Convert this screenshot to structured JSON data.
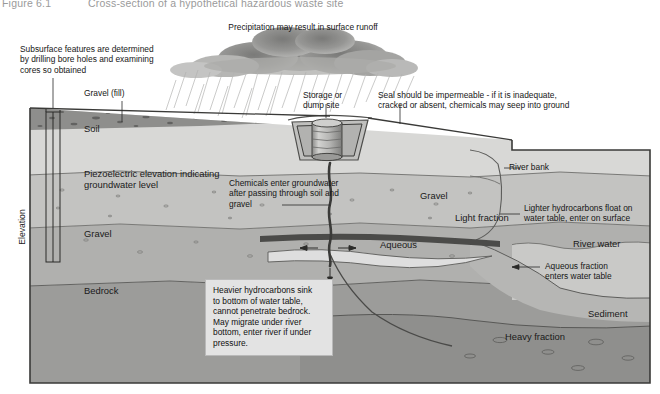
{
  "figure": {
    "number": "Figure 6.1",
    "title": "Cross-section of a hypothetical hazardous waste site"
  },
  "annotations": {
    "precipitation": "Precipitation may result in surface runoff",
    "boreholes": "Subsurface features are determined\nby drilling bore holes and examining\ncores so obtained",
    "gravel_fill": "Gravel (fill)",
    "storage_site": "Storage or\ndump site",
    "seal": "Seal should be impermeable - if it is inadequate,\ncracked or absent, chemicals may seep into ground",
    "chemicals_enter": "Chemicals enter groundwater\nafter passing through soil and\ngravel",
    "river_bank": "River bank",
    "lighter_hydrocarbons": "Lighter hydrocarbons float on\nwater table, enter on surface",
    "aqueous_fraction": "Aqueous fraction\nenters water table",
    "heavier_hydrocarbons": "Heavier hydrocarbons sink\nto bottom of water table,\ncannot penetrate bedrock.\nMay migrate under river\nbottom, enter river if under\npressure."
  },
  "strata": {
    "soil": "Soil",
    "piezo": "Piezoelectric elevation indicating\ngroundwater level",
    "gravel_left": "Gravel",
    "bedrock": "Bedrock",
    "gravel_right": "Gravel",
    "light_fraction": "Light fraction",
    "aqueous": "Aqueous",
    "river_water": "River water",
    "sediment": "Sediment",
    "heavy_fraction": "Heavy fraction"
  },
  "axis": {
    "elevation": "Elevation"
  },
  "colors": {
    "soil": "#d8d8d6",
    "aquifer": "#c3c3c1",
    "gravel": "#b0b0ae",
    "bedrock": "#9c9c9a",
    "fill": "#8e8e8c",
    "river_water": "#c9c9c7",
    "sediment": "#b6b6b4",
    "heavy": "#9a9a98",
    "plume": "#3a3a38",
    "cloud": "#a9a9a7",
    "frame": "#3a3a38",
    "callout_bg": "#e3e3e3"
  }
}
